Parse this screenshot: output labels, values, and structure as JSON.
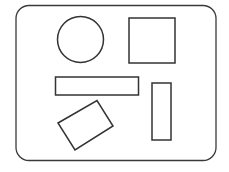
{
  "diagram": {
    "stroke_color": "#333333",
    "background": "#ffffff",
    "shapes": [
      {
        "type": "rounded-rectangle",
        "role": "frame"
      },
      {
        "type": "circle"
      },
      {
        "type": "square"
      },
      {
        "type": "horizontal-rectangle"
      },
      {
        "type": "vertical-rectangle"
      },
      {
        "type": "rotated-rectangle"
      }
    ]
  }
}
